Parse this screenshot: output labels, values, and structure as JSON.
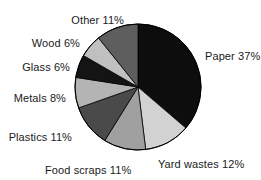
{
  "chart_data": {
    "type": "pie",
    "title": "",
    "subtitle": "",
    "xlabel": "",
    "ylabel": "",
    "legend_position": "none",
    "grid": false,
    "units": "percent",
    "start_angle_deg": 0,
    "direction": "clockwise",
    "categories": [
      "Paper",
      "Yard wastes",
      "Food scraps",
      "Plastics",
      "Metals",
      "Glass",
      "Wood",
      "Other"
    ],
    "values": [
      37,
      12,
      11,
      11,
      8,
      6,
      6,
      11
    ],
    "total": 102,
    "slices": [
      {
        "name": "Paper",
        "value": 37,
        "label": "Paper 37%",
        "color": "#0d0d0d",
        "start_deg": 0,
        "end_deg": 130.6,
        "label_x": 205,
        "label_y": 50,
        "label_align": "left"
      },
      {
        "name": "Yard wastes",
        "value": 12,
        "label": "Yard wastes 12%",
        "color": "#d2d2d2",
        "start_deg": 130.6,
        "end_deg": 173.0,
        "label_x": 158,
        "label_y": 158,
        "label_align": "left"
      },
      {
        "name": "Food scraps",
        "value": 11,
        "label": "Food scraps 11%",
        "color": "#a0a0a0",
        "start_deg": 173.0,
        "end_deg": 211.8,
        "label_x": 45,
        "label_y": 164,
        "label_align": "left"
      },
      {
        "name": "Plastics",
        "value": 11,
        "label": "Plastics 11%",
        "color": "#4a4a4a",
        "start_deg": 211.8,
        "end_deg": 250.6,
        "label_x": 72,
        "label_y": 131,
        "label_align": "right"
      },
      {
        "name": "Metals",
        "value": 8,
        "label": "Metals 8%",
        "color": "#b4b4b4",
        "start_deg": 250.6,
        "end_deg": 278.8,
        "label_x": 66,
        "label_y": 92,
        "label_align": "right"
      },
      {
        "name": "Glass",
        "value": 6,
        "label": "Glass 6%",
        "color": "#141414",
        "start_deg": 278.8,
        "end_deg": 300.0,
        "label_x": 70,
        "label_y": 61,
        "label_align": "right"
      },
      {
        "name": "Wood",
        "value": 6,
        "label": "Wood 6%",
        "color": "#c0c0c0",
        "start_deg": 300.0,
        "end_deg": 321.2,
        "label_x": 80,
        "label_y": 37,
        "label_align": "right"
      },
      {
        "name": "Other",
        "value": 11,
        "label": "Other 11%",
        "color": "#5e5e5e",
        "start_deg": 321.2,
        "end_deg": 360.0,
        "label_x": 124,
        "label_y": 14,
        "label_align": "right"
      }
    ],
    "geometry": {
      "center_x": 138,
      "center_y": 87,
      "radius": 63
    },
    "colors": {
      "background": "#ffffff",
      "text": "#1a1a1a",
      "outline": "#000000"
    }
  }
}
